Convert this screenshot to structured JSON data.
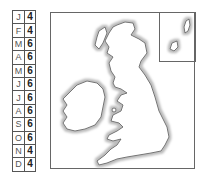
{
  "table": {
    "rows": [
      {
        "month": "J",
        "value": "4"
      },
      {
        "month": "F",
        "value": "4"
      },
      {
        "month": "M",
        "value": "6"
      },
      {
        "month": "A",
        "value": "6"
      },
      {
        "month": "M",
        "value": "6"
      },
      {
        "month": "J",
        "value": "6"
      },
      {
        "month": "J",
        "value": "6"
      },
      {
        "month": "A",
        "value": "6"
      },
      {
        "month": "S",
        "value": "6"
      },
      {
        "month": "O",
        "value": "6"
      },
      {
        "month": "N",
        "value": "4"
      },
      {
        "month": "D",
        "value": "4"
      }
    ]
  },
  "map": {
    "region": "Great Britain and Ireland",
    "inset": "Shetland / Orkney islands",
    "colors": {
      "coast": "#555555",
      "glow": "#bbbbbb",
      "land": "#ffffff"
    }
  }
}
